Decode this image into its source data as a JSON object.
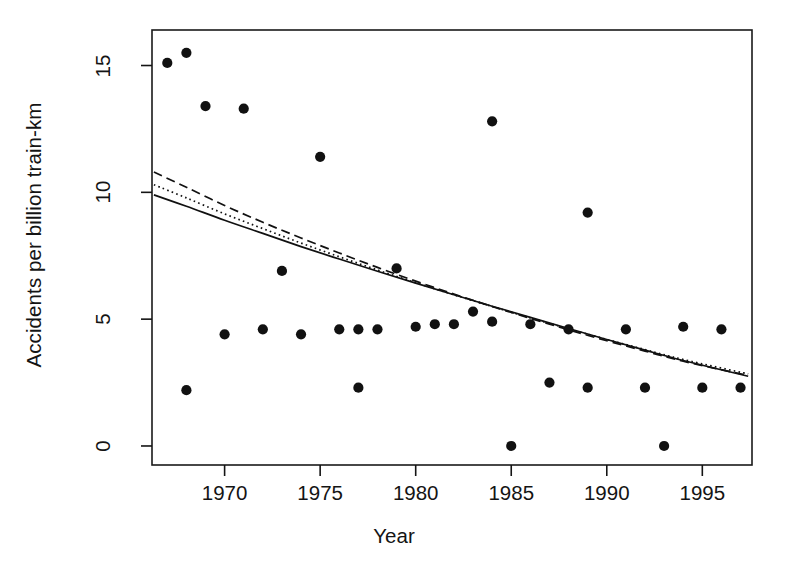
{
  "figure": {
    "background": "#ffffff",
    "ink_color": "#141414"
  },
  "chart_data": {
    "type": "scatter",
    "title": "",
    "subtitle": "",
    "xlabel": "Year",
    "ylabel": "Accidents per billion train-km",
    "xlim": [
      1966.2,
      1997.6
    ],
    "ylim": [
      -0.75,
      16.4
    ],
    "grid": false,
    "legend": "none",
    "xticks": [
      1970,
      1975,
      1980,
      1985,
      1990,
      1995
    ],
    "xtick_labels": [
      "1970",
      "1975",
      "1980",
      "1985",
      "1990",
      "1995"
    ],
    "yticks": [
      0,
      5,
      10,
      15
    ],
    "ytick_labels": [
      "0",
      "5",
      "10",
      "15"
    ],
    "marker": "filled-circle",
    "marker_color": "#111111",
    "points": [
      {
        "x": 1967,
        "y": 15.1
      },
      {
        "x": 1968,
        "y": 15.5
      },
      {
        "x": 1968,
        "y": 2.2
      },
      {
        "x": 1969,
        "y": 13.4
      },
      {
        "x": 1970,
        "y": 4.4
      },
      {
        "x": 1971,
        "y": 13.3
      },
      {
        "x": 1972,
        "y": 4.6
      },
      {
        "x": 1973,
        "y": 6.9
      },
      {
        "x": 1974,
        "y": 4.4
      },
      {
        "x": 1975,
        "y": 11.4
      },
      {
        "x": 1976,
        "y": 4.6
      },
      {
        "x": 1977,
        "y": 4.6
      },
      {
        "x": 1977,
        "y": 2.3
      },
      {
        "x": 1978,
        "y": 4.6
      },
      {
        "x": 1979,
        "y": 7.0
      },
      {
        "x": 1980,
        "y": 4.7
      },
      {
        "x": 1981,
        "y": 4.8
      },
      {
        "x": 1982,
        "y": 4.8
      },
      {
        "x": 1983,
        "y": 5.3
      },
      {
        "x": 1984,
        "y": 12.8
      },
      {
        "x": 1984,
        "y": 4.9
      },
      {
        "x": 1985,
        "y": 0.0
      },
      {
        "x": 1986,
        "y": 4.8
      },
      {
        "x": 1987,
        "y": 2.5
      },
      {
        "x": 1988,
        "y": 4.6
      },
      {
        "x": 1989,
        "y": 9.2
      },
      {
        "x": 1989,
        "y": 2.3
      },
      {
        "x": 1991,
        "y": 4.6
      },
      {
        "x": 1992,
        "y": 2.3
      },
      {
        "x": 1993,
        "y": 0.0
      },
      {
        "x": 1994,
        "y": 4.7
      },
      {
        "x": 1995,
        "y": 2.3
      },
      {
        "x": 1996,
        "y": 4.6
      },
      {
        "x": 1997,
        "y": 2.3
      }
    ],
    "series": [
      {
        "name": "solid-fit",
        "style": "solid",
        "color": "#111111",
        "x": [
          1966.3,
          1968,
          1970,
          1972,
          1974,
          1976,
          1978,
          1980,
          1982,
          1984,
          1986,
          1988,
          1990,
          1992,
          1994,
          1997.4
        ],
        "values": [
          9.9,
          9.45,
          8.9,
          8.38,
          7.86,
          7.37,
          6.89,
          6.42,
          5.96,
          5.51,
          5.07,
          4.63,
          4.2,
          3.78,
          3.37,
          2.75
        ]
      },
      {
        "name": "dotted-fit",
        "style": "dotted",
        "color": "#111111",
        "x": [
          1966.3,
          1968,
          1970,
          1972,
          1974,
          1976,
          1978,
          1980,
          1982,
          1984,
          1986,
          1988,
          1990,
          1992,
          1994,
          1997.4
        ],
        "values": [
          10.3,
          9.78,
          9.15,
          8.57,
          8.0,
          7.46,
          6.94,
          6.44,
          5.96,
          5.5,
          5.05,
          4.62,
          4.2,
          3.8,
          3.41,
          2.84
        ]
      },
      {
        "name": "dashed-fit",
        "style": "dashed",
        "color": "#111111",
        "x": [
          1966.3,
          1968,
          1970,
          1972,
          1974,
          1976,
          1978,
          1980,
          1982,
          1984,
          1986,
          1988,
          1990,
          1992,
          1994,
          1997.4
        ],
        "values": [
          10.8,
          10.2,
          9.48,
          8.82,
          8.2,
          7.61,
          7.04,
          6.5,
          5.99,
          5.5,
          5.03,
          4.58,
          4.15,
          3.74,
          3.34,
          2.78
        ]
      }
    ]
  }
}
